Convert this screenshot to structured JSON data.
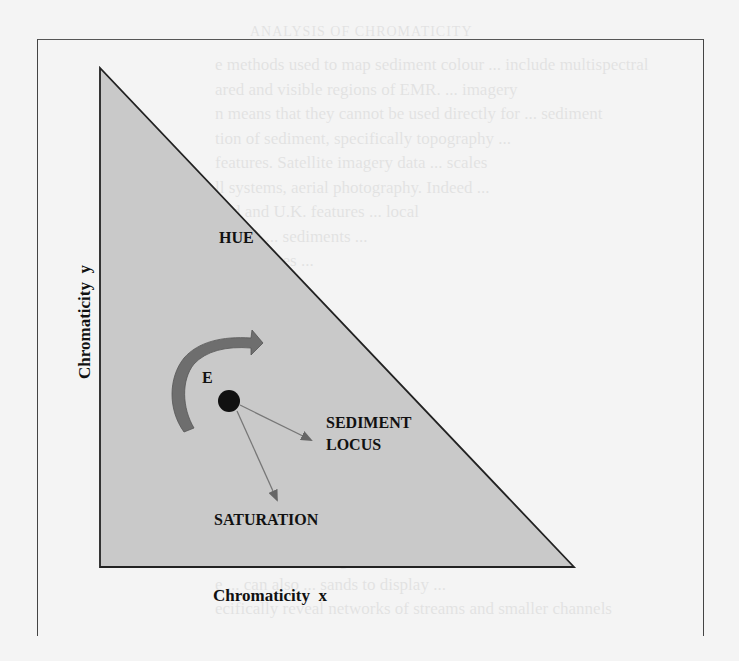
{
  "figure": {
    "labels": {
      "hue": "HUE",
      "point": "E",
      "sediment_locus_line1": "SEDIMENT",
      "sediment_locus_line2": "LOCUS",
      "saturation": "SATURATION",
      "x_axis": "Chromaticity  x",
      "y_axis": "Chromaticity  y"
    },
    "colors": {
      "triangle_fill": "#c9c9c9",
      "stroke": "#222222",
      "arrow_fill": "#6e6e6e",
      "point": "#111111",
      "background": "#f4f4f4"
    }
  },
  "bleed_through": {
    "heading": "ANALYSIS OF CHROMATICITY",
    "lines": [
      "e methods used to map sediment colour ... include multispectral",
      "ared and visible regions of EMR. ... imagery",
      "n means that they cannot be used directly for ... sediment",
      "tion of sediment, specifically topography ...",
      "features. Satellite imagery data ... scales",
      "ll systems, aerial photography. Indeed ...",
      "ond and U.K. features ... local",
      "lecting ... sediments ...",
      "s ... features ...",
      "equent ... of ...",
      "e ... between ...",
      "e ... patches ...",
      "al ... within ...",
      "ofted ... by ...",
      "lume ... Dancer ..."
    ],
    "lines_bottom": [
      "e of remote sensing ... can be used to",
      "e ... can also ... sands to display ...",
      "ecifically reveal networks of streams and smaller channels"
    ]
  }
}
